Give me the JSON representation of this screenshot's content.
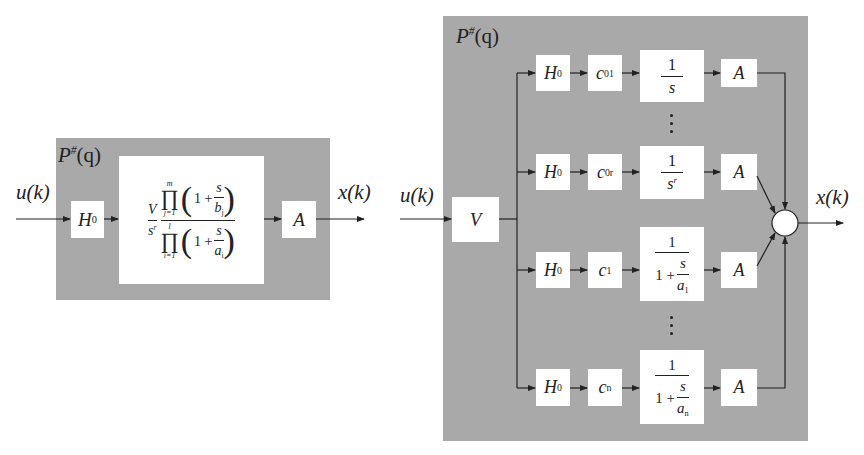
{
  "left_diagram": {
    "panel_label": "P#(q)",
    "panel_label_base": "P",
    "panel_label_sup": "#",
    "panel_label_arg": "(q)",
    "input_label": "u(k)",
    "output_label": "x(k)",
    "blocks": {
      "hold": {
        "base": "H",
        "sub": "0"
      },
      "transfer": {
        "gain": "V",
        "gain_den_base": "s",
        "gain_den_sup": "r",
        "num_prod_upper": "m",
        "num_prod_lower": "j=1",
        "num_term_one": "1 +",
        "num_term_frac_num": "s",
        "num_term_frac_den_base": "b",
        "num_term_frac_den_sub": "j",
        "den_prod_upper": "l",
        "den_prod_lower": "i=1",
        "den_term_one": "1 +",
        "den_term_frac_num": "s",
        "den_term_frac_den_base": "a",
        "den_term_frac_den_sub": "i"
      },
      "output_gain": "A"
    }
  },
  "right_diagram": {
    "panel_label_base": "P",
    "panel_label_sup": "#",
    "panel_label_arg": "(q)",
    "input_label": "u(k)",
    "output_label": "x(k)",
    "gain_block": "V",
    "rows": [
      {
        "hold_base": "H",
        "hold_sub": "0",
        "coef_base": "c",
        "coef_sub": "01",
        "tf_num": "1",
        "tf_den_base": "s",
        "tf_den_sup": "",
        "tf_den_sub": "",
        "tf_type": "integrator",
        "out": "A"
      },
      {
        "hold_base": "H",
        "hold_sub": "0",
        "coef_base": "c",
        "coef_sub": "0r",
        "tf_num": "1",
        "tf_den_base": "s",
        "tf_den_sup": "r",
        "tf_den_sub": "",
        "tf_type": "integrator",
        "out": "A"
      },
      {
        "hold_base": "H",
        "hold_sub": "0",
        "coef_base": "c",
        "coef_sub": "1",
        "tf_num": "1",
        "tf_den_one": "1 +",
        "tf_den_frac_num": "s",
        "tf_den_frac_den_base": "a",
        "tf_den_frac_den_sub": "1",
        "tf_type": "pole",
        "out": "A"
      },
      {
        "hold_base": "H",
        "hold_sub": "0",
        "coef_base": "c",
        "coef_sub": "n",
        "tf_num": "1",
        "tf_den_one": "1 +",
        "tf_den_frac_num": "s",
        "tf_den_frac_den_base": "a",
        "tf_den_frac_den_sub": "n",
        "tf_type": "pole",
        "out": "A"
      }
    ],
    "summing_junction": "sum"
  },
  "colors": {
    "panel": "#a9a9a9",
    "block": "#ffffff",
    "line": "#222222"
  }
}
